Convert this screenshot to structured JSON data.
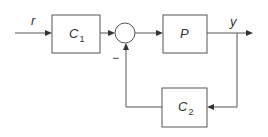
{
  "diagram": {
    "type": "feedback-block-diagram",
    "signals": {
      "input": "r",
      "output": "y"
    },
    "blocks": [
      {
        "id": "C1",
        "name": "C",
        "subscript": "1"
      },
      {
        "id": "P",
        "name": "P",
        "subscript": ""
      },
      {
        "id": "C2",
        "name": "C",
        "subscript": "2"
      }
    ],
    "summing_junction": {
      "feedback_sign": "−"
    },
    "connections": [
      {
        "from": "r",
        "to": "C1"
      },
      {
        "from": "C1",
        "to": "sum"
      },
      {
        "from": "sum",
        "to": "P"
      },
      {
        "from": "P",
        "to": "y"
      },
      {
        "from": "y",
        "to": "C2"
      },
      {
        "from": "C2",
        "to": "sum",
        "sign": "−"
      }
    ]
  }
}
